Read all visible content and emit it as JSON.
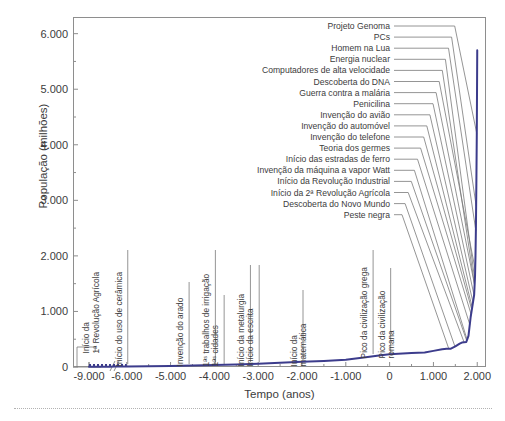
{
  "chart_data": {
    "type": "line",
    "title": "",
    "xlabel": "Tempo (anos)",
    "ylabel": "População (milhões)",
    "xlim": [
      -9000,
      2200
    ],
    "ylim": [
      0,
      6300
    ],
    "grid": false,
    "legend": "none",
    "axis_break": {
      "present": true,
      "after_tick": "-9.000",
      "symbol": "//"
    },
    "xticks": [
      "-9.000",
      "-6.000",
      "-5.000",
      "-4.000",
      "-3.000",
      "-2.000",
      "-1.000",
      "0",
      "1.000",
      "2.000"
    ],
    "xtick_values": [
      -9000,
      -6000,
      -5000,
      -4000,
      -3000,
      -2000,
      -1000,
      0,
      1000,
      2000
    ],
    "yticks": [
      "0",
      "1.000",
      "2.000",
      "3.000",
      "4.000",
      "5.000",
      "6.000"
    ],
    "ytick_values": [
      0,
      1000,
      2000,
      3000,
      4000,
      5000,
      6000
    ],
    "yminor_values": [
      500,
      1500,
      2500,
      3500,
      4500,
      5500
    ],
    "series": [
      {
        "name": "População mundial",
        "color": "#3c3c8c",
        "x": [
          -9000,
          -8000,
          -7000,
          -6500,
          -6000,
          -5500,
          -5000,
          -4500,
          -4000,
          -3500,
          -3000,
          -2500,
          -2000,
          -1500,
          -1000,
          -500,
          -200,
          0,
          200,
          500,
          800,
          1000,
          1200,
          1300,
          1400,
          1500,
          1600,
          1650,
          1750,
          1800,
          1850,
          1900,
          1930,
          1950,
          1960,
          1970,
          1980,
          1990,
          2000
        ],
        "y": [
          5,
          5,
          6,
          7,
          8,
          12,
          18,
          25,
          35,
          45,
          60,
          75,
          95,
          110,
          130,
          180,
          210,
          230,
          240,
          250,
          260,
          290,
          320,
          330,
          330,
          370,
          420,
          440,
          450,
          560,
          900,
          1150,
          1300,
          1650,
          2000,
          2500,
          3300,
          4200,
          5700
        ]
      }
    ],
    "annotations_right": [
      {
        "label": "Projeto Genoma",
        "year": 1990,
        "row": 0
      },
      {
        "label": "PCs",
        "year": 1975,
        "row": 1
      },
      {
        "label": "Homem na Lua",
        "year": 1969,
        "row": 2
      },
      {
        "label": "Energia nuclear",
        "year": 1945,
        "row": 3
      },
      {
        "label": "Computadores de alta velocidade",
        "year": 1940,
        "row": 4
      },
      {
        "label": "Descoberta do DNA",
        "year": 1953,
        "row": 5
      },
      {
        "label": "Guerra contra a malária",
        "year": 1940,
        "row": 6
      },
      {
        "label": "Penicilina",
        "year": 1928,
        "row": 7
      },
      {
        "label": "Invenção do avião",
        "year": 1903,
        "row": 8
      },
      {
        "label": "Invenção do automóvel",
        "year": 1885,
        "row": 9
      },
      {
        "label": "Invenção do telefone",
        "year": 1876,
        "row": 10
      },
      {
        "label": "Teoria dos germes",
        "year": 1860,
        "row": 11
      },
      {
        "label": "Início das estradas de ferro",
        "year": 1830,
        "row": 12
      },
      {
        "label": "Invenção da máquina a vapor Watt",
        "year": 1769,
        "row": 13
      },
      {
        "label": "Início da Revolução Industrial",
        "year": 1760,
        "row": 14
      },
      {
        "label": "Início da 2ª Revolução Agrícola",
        "year": 1700,
        "row": 15
      },
      {
        "label": "Descoberta do Novo Mundo",
        "year": 1492,
        "row": 16
      },
      {
        "label": "Peste negra",
        "year": 1350,
        "row": 17
      }
    ],
    "annotations_inline": [
      {
        "label": "Início da\n1ª Revolução Agrícola",
        "year": -8500
      },
      {
        "label": "Início do uso de cerâmica",
        "year": -6000
      },
      {
        "label": "Invenção do arado",
        "year": -4600
      },
      {
        "label": "1ªˢ trabalhos de irrigação",
        "year": -4000
      },
      {
        "label": "1ªˢ cidades",
        "year": -3800
      },
      {
        "label": "Início da metalurgia",
        "year": -3200
      },
      {
        "label": "Início da escrita",
        "year": -3000
      },
      {
        "label": "Início da\nmatemática",
        "year": -2000
      },
      {
        "label": "Pico da civilização grega",
        "year": -400
      },
      {
        "label": "Pico da civilização\nromana",
        "year": 1
      }
    ]
  },
  "axis": {
    "x_title": "Tempo (anos)",
    "y_title": "População (milhões)"
  },
  "inline_labels": {
    "a0_line1": "Início da",
    "a0_line2": "1ª Revolução Agrícola",
    "a1": "Início do uso de cerâmica",
    "a2": "Invenção do arado",
    "a3": "1ªˢ trabalhos de irrigação",
    "a4": "1ªˢ cidades",
    "a5": "Início da metalurgia",
    "a6": "Início da escrita",
    "a7_line1": "Início da",
    "a7_line2": "matemática",
    "a8": "Pico da civilização grega",
    "a9_line1": "Pico da civilização",
    "a9_line2": "romana"
  },
  "colors": {
    "curve": "#3c3c8c",
    "axis": "#8e8e8e",
    "leader": "#7a7a7a",
    "text": "#3c3c3c",
    "rule": "#b2b2b2",
    "background": "#ffffff"
  }
}
